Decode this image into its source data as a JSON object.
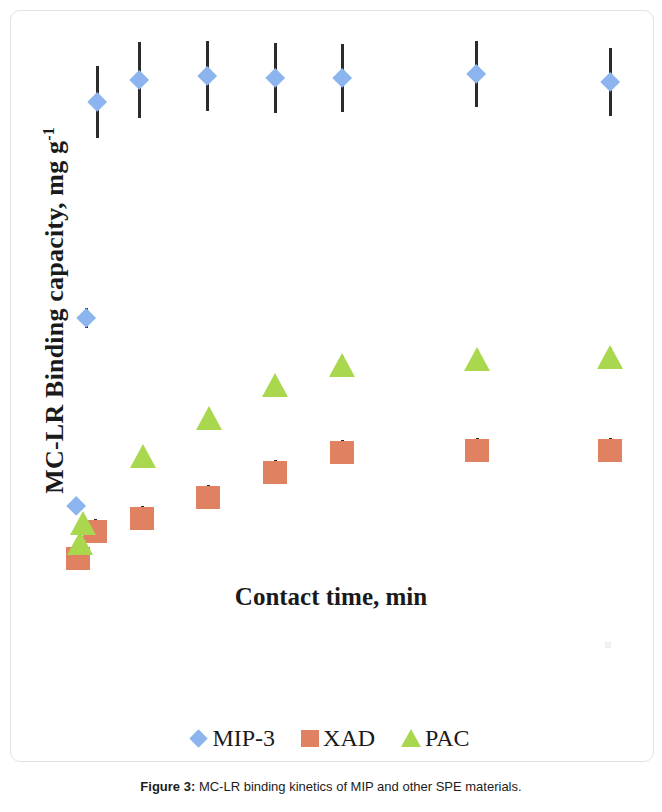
{
  "figure": {
    "caption_label": "Figure 3:",
    "caption_text": " MC-LR binding kinetics of MIP and other SPE materials."
  },
  "chart_data": {
    "type": "scatter",
    "title": "",
    "xlabel": "Contact time, min",
    "ylabel_main": "MC-LR Binding capacity, mg g",
    "ylabel_sup": "-1",
    "grid": false,
    "legend_position": "bottom",
    "axis_ticks_shown": false,
    "colors": {
      "MIP-3": "#8cb4ee",
      "XAD": "#e08161",
      "PAC": "#a9d84f",
      "errorbar": "#2b2b2b"
    },
    "note": "Axis tick labels are not rendered in the source figure; x/y values below are read off marker pixel positions (x in arbitrary contact-time order, y as relative binding capacity).",
    "series": [
      {
        "name": "MIP-3",
        "marker": "diamond",
        "points": [
          {
            "px": 76,
            "py": 506,
            "err": 6
          },
          {
            "px": 86,
            "py": 318,
            "err": 10
          },
          {
            "px": 97,
            "py": 102,
            "err": 36
          },
          {
            "px": 139,
            "py": 80,
            "err": 38
          },
          {
            "px": 207,
            "py": 76,
            "err": 35
          },
          {
            "px": 275,
            "py": 78,
            "err": 35
          },
          {
            "px": 342,
            "py": 78,
            "err": 34
          },
          {
            "px": 476,
            "py": 74,
            "err": 33
          },
          {
            "px": 610,
            "py": 82,
            "err": 34
          }
        ]
      },
      {
        "name": "XAD",
        "marker": "square",
        "points": [
          {
            "px": 78,
            "py": 558,
            "err": 9
          },
          {
            "px": 95,
            "py": 531,
            "err": 12
          },
          {
            "px": 142,
            "py": 518,
            "err": 12
          },
          {
            "px": 208,
            "py": 497,
            "err": 12
          },
          {
            "px": 275,
            "py": 472,
            "err": 12
          },
          {
            "px": 342,
            "py": 452,
            "err": 12
          },
          {
            "px": 477,
            "py": 450,
            "err": 12
          },
          {
            "px": 610,
            "py": 450,
            "err": 12
          }
        ]
      },
      {
        "name": "PAC",
        "marker": "triangle",
        "points": [
          {
            "px": 83,
            "py": 523,
            "err": 5
          },
          {
            "px": 80,
            "py": 543,
            "err": 5
          },
          {
            "px": 143,
            "py": 456,
            "err": 5
          },
          {
            "px": 209,
            "py": 418,
            "err": 5
          },
          {
            "px": 275,
            "py": 385,
            "err": 7
          },
          {
            "px": 342,
            "py": 365,
            "err": 9
          },
          {
            "px": 477,
            "py": 359,
            "err": 9
          },
          {
            "px": 610,
            "py": 357,
            "err": 9
          }
        ]
      }
    ],
    "legend": [
      {
        "label": "MIP-3",
        "marker": "diamond",
        "color": "#8cb4ee"
      },
      {
        "label": "XAD",
        "marker": "square",
        "color": "#e08161"
      },
      {
        "label": "PAC",
        "marker": "triangle",
        "color": "#a9d84f"
      }
    ]
  }
}
